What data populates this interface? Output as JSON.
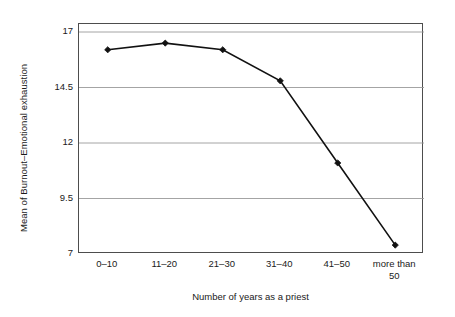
{
  "chart_data": {
    "type": "line",
    "title": "",
    "subtitle": "",
    "xlabel": "Number of years as a priest",
    "ylabel": "Mean of Burnout–Emotional exhaustion",
    "categories": [
      "0–10",
      "11–20",
      "21–30",
      "31–40",
      "41–50",
      "more than 50"
    ],
    "values": [
      16.2,
      16.5,
      16.2,
      14.8,
      11.1,
      7.4
    ],
    "series": [
      {
        "name": "Mean of Burnout–Emotional exhaustion",
        "values": [
          16.2,
          16.5,
          16.2,
          14.8,
          11.1,
          7.4
        ]
      }
    ],
    "ylim": [
      7,
      17
    ],
    "yticks": [
      7,
      9.5,
      12,
      14.5,
      17
    ],
    "ytick_labels": [
      "7",
      "9.5",
      "12",
      "14.5",
      "17"
    ],
    "xtick_labels": [
      "0–10",
      "11–20",
      "21–30",
      "31–40",
      "41–50",
      "more than 50"
    ],
    "grid": true,
    "grid_axis": "y",
    "legend": false,
    "legend_position": "none",
    "marker": "filled-diamond",
    "line_color": "#111111",
    "marker_color": "#111111",
    "grid_color": "#9a9a9a",
    "frame_color": "#4d4d4d",
    "background_color": "#ffffff",
    "annotations": []
  },
  "axes": {
    "y_title": "Mean of Burnout–Emotional exhaustion",
    "x_title": "Number of years as a priest",
    "y_ticks": [
      {
        "label": "17",
        "value": 17
      },
      {
        "label": "14.5",
        "value": 14.5
      },
      {
        "label": "12",
        "value": 12
      },
      {
        "label": "9.5",
        "value": 9.5
      },
      {
        "label": "7",
        "value": 7
      }
    ],
    "x_ticks": [
      {
        "line1": "0–10",
        "line2": ""
      },
      {
        "line1": "11–20",
        "line2": ""
      },
      {
        "line1": "21–30",
        "line2": ""
      },
      {
        "line1": "31–40",
        "line2": ""
      },
      {
        "line1": "41–50",
        "line2": ""
      },
      {
        "line1": "more than",
        "line2": "50"
      }
    ]
  }
}
